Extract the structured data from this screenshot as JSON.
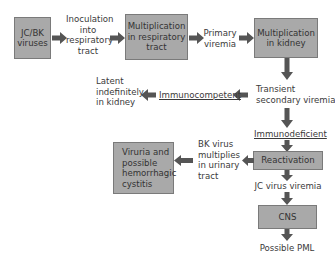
{
  "diagram": {
    "type": "flowchart",
    "colors": {
      "box_fill": "#a9a9a9",
      "box_border": "#7a7a7a",
      "arrow": "#555555",
      "text": "#3a3a3a"
    },
    "nodes": {
      "jcbk": {
        "line1": "JC/BK",
        "line2": "viruses"
      },
      "inoculation": {
        "line1": "Inoculation",
        "line2": "into",
        "line3": "respiratory",
        "line4": "tract"
      },
      "mult_resp": {
        "line1": "Multiplication",
        "line2": "in respiratory",
        "line3": "tract"
      },
      "primary_viremia": {
        "line1": "Primary",
        "line2": "viremia"
      },
      "mult_kidney": {
        "line1": "Multiplication",
        "line2": "in kidney"
      },
      "transient": {
        "line1": "Transient",
        "line2": "secondary viremia"
      },
      "immunocompetent": {
        "label": "Immunocompetent"
      },
      "latent": {
        "line1": "Latent",
        "line2": "indefinitely",
        "line3": "in kidney"
      },
      "immunodeficient": {
        "label": "Immunodeficient"
      },
      "reactivation": {
        "label": "Reactivation"
      },
      "bk_multiplies": {
        "line1": "BK virus",
        "line2": "multiplies",
        "line3": "in urinary",
        "line4": "tract"
      },
      "viruria": {
        "line1": "Viruria and",
        "line2": "possible",
        "line3": "hemorrhagic",
        "line4": "cystitis"
      },
      "jc_viremia": {
        "label": "JC virus viremia"
      },
      "cns": {
        "label": "CNS"
      },
      "pml": {
        "label": "Possible PML"
      }
    },
    "edges": [
      [
        "JC/BK viruses",
        "Inoculation into respiratory tract"
      ],
      [
        "Inoculation into respiratory tract",
        "Multiplication in respiratory tract"
      ],
      [
        "Multiplication in respiratory tract",
        "Primary viremia"
      ],
      [
        "Primary viremia",
        "Multiplication in kidney"
      ],
      [
        "Multiplication in kidney",
        "Transient secondary viremia"
      ],
      [
        "Transient secondary viremia",
        "Immunocompetent"
      ],
      [
        "Immunocompetent",
        "Latent indefinitely in kidney"
      ],
      [
        "Transient secondary viremia",
        "Immunodeficient"
      ],
      [
        "Immunodeficient",
        "Reactivation"
      ],
      [
        "Reactivation",
        "BK virus multiplies in urinary tract"
      ],
      [
        "BK virus multiplies in urinary tract",
        "Viruria and possible hemorrhagic cystitis"
      ],
      [
        "Reactivation",
        "JC virus viremia"
      ],
      [
        "JC virus viremia",
        "CNS"
      ],
      [
        "CNS",
        "Possible PML"
      ]
    ]
  }
}
